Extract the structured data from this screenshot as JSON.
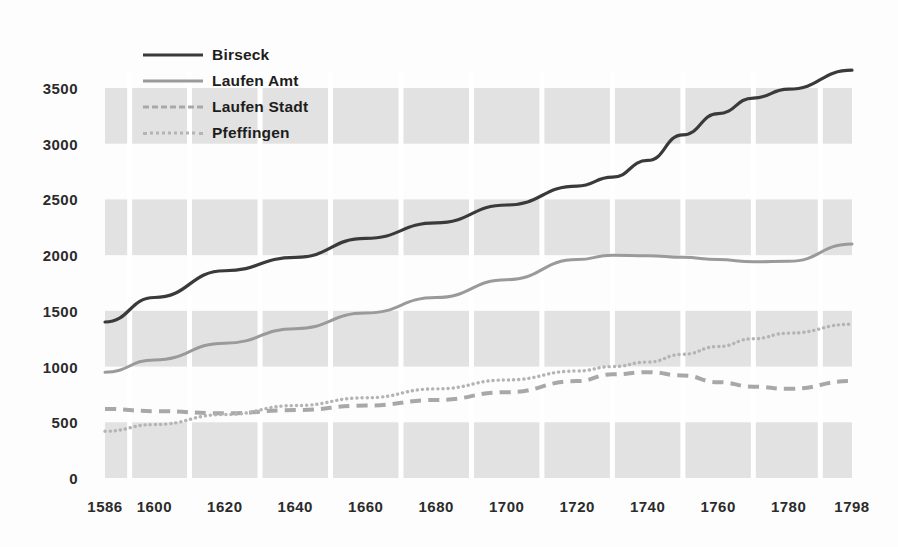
{
  "chart_data": {
    "type": "line",
    "title": "",
    "subtitle": "",
    "xlabel": "",
    "ylabel": "",
    "xlim": [
      1586,
      1798
    ],
    "ylim": [
      0,
      3650
    ],
    "grid": true,
    "legend_position": "top-left",
    "x_tick_labels": [
      "1586",
      "1600",
      "1620",
      "1640",
      "1660",
      "1680",
      "1700",
      "1720",
      "1740",
      "1760",
      "1780",
      "1798"
    ],
    "x_ticks": [
      1586,
      1600,
      1620,
      1640,
      1660,
      1680,
      1700,
      1720,
      1740,
      1760,
      1780,
      1798
    ],
    "y_tick_labels": [
      "0",
      "500",
      "1000",
      "1500",
      "2000",
      "2500",
      "3000",
      "3500"
    ],
    "y_ticks": [
      0,
      500,
      1000,
      1500,
      2000,
      2500,
      3000,
      3500
    ],
    "series": [
      {
        "name": "Birseck",
        "style": "solid",
        "color": "#3a3a3a",
        "x": [
          1586,
          1600,
          1620,
          1640,
          1660,
          1680,
          1700,
          1720,
          1730,
          1740,
          1750,
          1760,
          1770,
          1780,
          1798
        ],
        "values": [
          1400,
          1620,
          1860,
          1980,
          2150,
          2290,
          2450,
          2620,
          2700,
          2850,
          3080,
          3270,
          3410,
          3490,
          3660
        ]
      },
      {
        "name": "Laufen Amt",
        "style": "solid",
        "color": "#9a9a9a",
        "x": [
          1586,
          1600,
          1620,
          1640,
          1660,
          1680,
          1700,
          1720,
          1730,
          1740,
          1750,
          1760,
          1770,
          1780,
          1798
        ],
        "values": [
          950,
          1060,
          1210,
          1340,
          1480,
          1620,
          1780,
          1960,
          2000,
          1995,
          1980,
          1960,
          1940,
          1945,
          2100
        ]
      },
      {
        "name": "Laufen Stadt",
        "style": "dashed",
        "color": "#a8a8a8",
        "x": [
          1586,
          1600,
          1620,
          1640,
          1660,
          1680,
          1700,
          1720,
          1730,
          1740,
          1750,
          1760,
          1770,
          1780,
          1798
        ],
        "values": [
          620,
          600,
          580,
          610,
          650,
          700,
          770,
          870,
          930,
          950,
          920,
          860,
          820,
          800,
          870
        ]
      },
      {
        "name": "Pfeffingen",
        "style": "dotted",
        "color": "#b4b4b4",
        "x": [
          1586,
          1600,
          1620,
          1640,
          1660,
          1680,
          1700,
          1720,
          1730,
          1740,
          1750,
          1760,
          1770,
          1780,
          1798
        ],
        "values": [
          420,
          480,
          570,
          650,
          720,
          800,
          880,
          960,
          1000,
          1040,
          1110,
          1180,
          1250,
          1300,
          1380
        ]
      }
    ]
  },
  "legend": {
    "items": [
      {
        "label": "Birseck"
      },
      {
        "label": "Laufen Amt"
      },
      {
        "label": "Laufen Stadt"
      },
      {
        "label": "Pfeffingen"
      }
    ]
  }
}
